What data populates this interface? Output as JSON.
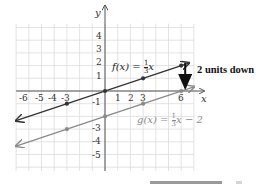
{
  "chart_data": {
    "type": "line",
    "title": "",
    "xlabel": "x",
    "ylabel": "y",
    "xlim": [
      -7,
      7
    ],
    "ylim": [
      -6,
      5
    ],
    "grid": true,
    "x_tick_labels": [
      "-6",
      "-5",
      "-4",
      "-3",
      "1",
      "2",
      "3",
      "6"
    ],
    "y_tick_labels": [
      "4",
      "3",
      "2",
      "1",
      "-1",
      "-3",
      "-4",
      "-5"
    ],
    "series": [
      {
        "name": "f(x) = (1/3)x",
        "label_text": "f(x) = ",
        "label_frac": "1/3",
        "label_suffix": "x",
        "color": "#333333",
        "x": [
          -7,
          -3,
          0,
          3,
          6,
          7
        ],
        "values": [
          -2.333,
          -1,
          0,
          1,
          2,
          2.333
        ],
        "marked_points": [
          [
            -3,
            -1
          ],
          [
            0,
            0
          ],
          [
            3,
            1
          ],
          [
            6,
            2
          ]
        ]
      },
      {
        "name": "g(x) = (1/3)x - 2",
        "label_text": "g(x) = ",
        "label_frac": "1/3",
        "label_suffix": "x − 2",
        "color": "#8a8a8a",
        "x": [
          -7,
          -3,
          0,
          3,
          6,
          7
        ],
        "values": [
          -4.333,
          -3,
          -2,
          -1,
          0,
          0.333
        ],
        "marked_points": [
          [
            -3,
            -3
          ],
          [
            0,
            -2
          ],
          [
            3,
            -1
          ],
          [
            6,
            0
          ]
        ]
      }
    ],
    "annotations": [
      {
        "text": "2 units down",
        "arrow_from": [
          6,
          2
        ],
        "arrow_to": [
          6,
          0
        ]
      }
    ]
  },
  "labels": {
    "x_axis": "x",
    "y_axis": "y",
    "annotation": "2 units down",
    "f_prefix": "f(x) = ",
    "f_suffix": "x",
    "g_prefix": "g(x) = ",
    "g_suffix": "x − 2",
    "frac_num": "1",
    "frac_den": "3"
  },
  "colors": {
    "grid": "#dcdcdc",
    "axis": "#555555",
    "f_line": "#333333",
    "g_line": "#8a8a8a",
    "arrow": "#111111"
  }
}
